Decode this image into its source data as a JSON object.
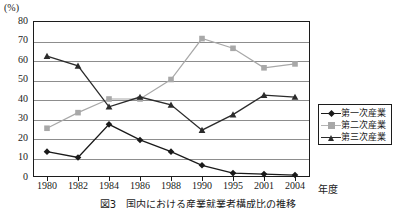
{
  "chart_data": {
    "type": "line",
    "title": "",
    "xlabel": "年度",
    "ylabel": "(%)",
    "ylim": [
      0,
      80
    ],
    "ytick_step": 10,
    "grid": true,
    "legend_position": "right",
    "categories": [
      "1980",
      "1982",
      "1984",
      "1986",
      "1988",
      "1990",
      "1995",
      "2001",
      "2004"
    ],
    "series": [
      {
        "name": "第一次産業",
        "marker": "diamond",
        "color": "#1a1a1a",
        "values": [
          13,
          10,
          27,
          19,
          13,
          6,
          2,
          1.5,
          1
        ]
      },
      {
        "name": "第二次産業",
        "marker": "square",
        "color": "#a8a8a8",
        "values": [
          25,
          33,
          40,
          40,
          50,
          71,
          66,
          56,
          58
        ]
      },
      {
        "name": "第三次産業",
        "marker": "triangle",
        "color": "#2b2b2b",
        "values": [
          62,
          57,
          36,
          41,
          37,
          24,
          32,
          42,
          41
        ]
      }
    ],
    "yticks": [
      "0",
      "10",
      "20",
      "30",
      "40",
      "50",
      "60",
      "70",
      "80"
    ]
  },
  "axis": {
    "unit_label": "(%)",
    "x_unit_label": "年度"
  },
  "legend": {
    "items": [
      {
        "label": "第一次産業"
      },
      {
        "label": "第二次産業"
      },
      {
        "label": "第三次産業"
      }
    ]
  },
  "caption": {
    "text": "図3　国内における産業就業者構成比の推移"
  }
}
